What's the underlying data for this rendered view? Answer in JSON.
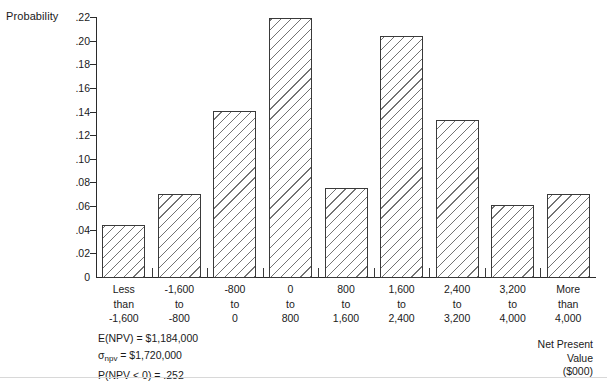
{
  "chart_data": {
    "type": "bar",
    "title": "",
    "subtitle": "",
    "xlabel": "Net Present Value ($000)",
    "ylabel": "Probability",
    "grid": false,
    "legend": "none",
    "ylim": [
      0,
      0.22
    ],
    "ytick_labels": [
      ".22",
      ".20",
      ".18",
      ".16",
      ".14",
      ".12",
      ".10",
      ".08",
      ".06",
      ".04",
      ".02",
      "0"
    ],
    "ytick_values": [
      0.22,
      0.2,
      0.18,
      0.16,
      0.14,
      0.12,
      0.1,
      0.08,
      0.06,
      0.04,
      0.02,
      0
    ],
    "categories": [
      "Less than -1,600",
      "-1,600 to -800",
      "-800 to 0",
      "0 to 800",
      "800 to 1,600",
      "1,600 to 2,400",
      "2,400 to 3,200",
      "3,200 to 4,000",
      "More than 4,000"
    ],
    "category_lines": [
      [
        "Less",
        "than",
        "-1,600"
      ],
      [
        "-1,600",
        "to",
        "-800"
      ],
      [
        "-800",
        "to",
        "0"
      ],
      [
        "0",
        "to",
        "800"
      ],
      [
        "800",
        "to",
        "1,600"
      ],
      [
        "1,600",
        "to",
        "2,400"
      ],
      [
        "2,400",
        "to",
        "3,200"
      ],
      [
        "3,200",
        "to",
        "4,000"
      ],
      [
        "More",
        "than",
        "4,000"
      ]
    ],
    "values": [
      0.045,
      0.071,
      0.141,
      0.22,
      0.076,
      0.205,
      0.134,
      0.062,
      0.071
    ]
  },
  "annotations": {
    "expected_value": "E(NPV) = $1,184,000",
    "std_dev_prefix": "σ",
    "std_dev_subscript": "npv",
    "std_dev_rest": " = $1,720,000",
    "probability_negative": "P(NPV < 0) = .252"
  },
  "axis_caption": {
    "line1": "Net Present",
    "line2": "Value",
    "line3": "($000)"
  },
  "colors": {
    "axis": "#2b2b2b",
    "bar_outline": "#3a3a3a",
    "hatch": "#5a5a5a",
    "background": "#ffffff"
  }
}
